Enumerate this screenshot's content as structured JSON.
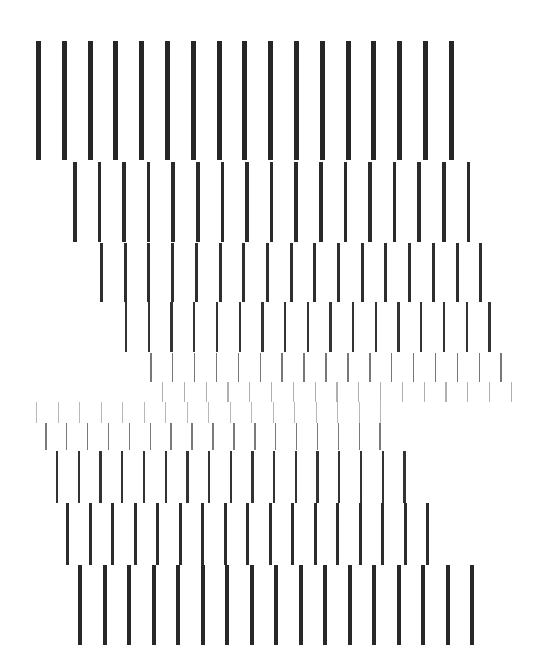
{
  "artwork": {
    "background": "#ffffff",
    "bars_per_row": 17,
    "rows": [
      {
        "id": "row-1",
        "x0": 36,
        "spacing": 25.8,
        "top": 41,
        "height": 119,
        "width": 5,
        "color": "#262626"
      },
      {
        "id": "row-2",
        "x0": 73,
        "spacing": 24.6,
        "top": 162,
        "height": 80,
        "width": 3.6,
        "color": "#2a2a2a"
      },
      {
        "id": "row-3",
        "x0": 100,
        "spacing": 23.7,
        "top": 243,
        "height": 59,
        "width": 3,
        "color": "#2e2e2e"
      },
      {
        "id": "row-4",
        "x0": 125,
        "spacing": 22.7,
        "top": 302,
        "height": 50,
        "width": 2.4,
        "color": "#333333"
      },
      {
        "id": "row-5",
        "x0": 150,
        "spacing": 21.9,
        "top": 353,
        "height": 29,
        "width": 1.6,
        "color": "#777777"
      },
      {
        "id": "row-6",
        "x0": 162,
        "spacing": 21.8,
        "top": 382,
        "height": 20,
        "width": 1.2,
        "color": "#b0b0b0"
      },
      {
        "id": "row-7",
        "x0": 36,
        "spacing": 21.5,
        "top": 402,
        "height": 21,
        "width": 1.2,
        "color": "#b8b8b8"
      },
      {
        "id": "row-8",
        "x0": 45,
        "spacing": 20.9,
        "top": 423,
        "height": 27,
        "width": 1.6,
        "color": "#7a7a7a"
      },
      {
        "id": "row-9",
        "x0": 56,
        "spacing": 21.7,
        "top": 451,
        "height": 52,
        "width": 2.4,
        "color": "#333333"
      },
      {
        "id": "row-10",
        "x0": 66,
        "spacing": 22.5,
        "top": 503,
        "height": 62,
        "width": 3.2,
        "color": "#2c2c2c"
      },
      {
        "id": "row-11",
        "x0": 78,
        "spacing": 24.5,
        "top": 565,
        "height": 80,
        "width": 4,
        "color": "#282828"
      }
    ]
  }
}
